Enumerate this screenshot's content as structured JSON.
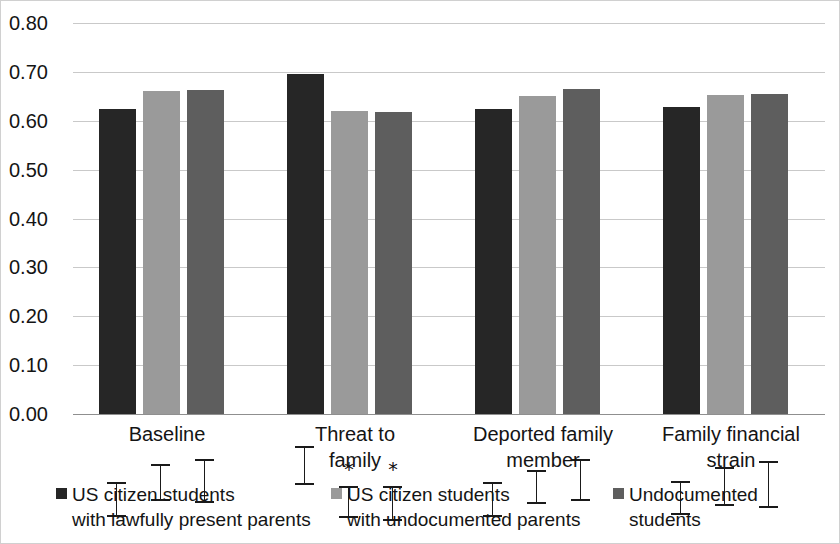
{
  "chart_data": {
    "type": "bar",
    "title": "",
    "subtitle": "",
    "xlabel": "",
    "ylabel": "",
    "ylim": [
      0.0,
      0.8
    ],
    "grid": true,
    "legend_position": "bottom",
    "ytick_labels": [
      "0.80",
      "0.70",
      "0.60",
      "0.50",
      "0.40",
      "0.30",
      "0.20",
      "0.10",
      "0.00"
    ],
    "ytick_values": [
      0.8,
      0.7,
      0.6,
      0.5,
      0.4,
      0.3,
      0.2,
      0.1,
      0.0
    ],
    "categories": [
      "Baseline",
      "Threat to\nfamily",
      "Deported family\nmember",
      "Family financial\nstrain"
    ],
    "series": [
      {
        "name": "US citizen students\nwith lawfully present parents",
        "color": "#262626",
        "values": [
          0.625,
          0.695,
          0.625,
          0.628
        ],
        "errors": [
          0.035,
          0.04,
          0.035,
          0.035
        ],
        "significance": [
          "",
          "",
          "",
          ""
        ]
      },
      {
        "name": "US citizen students\nwith undocumented parents",
        "color": "#9a9a9a",
        "values": [
          0.66,
          0.62,
          0.65,
          0.652
        ],
        "errors": [
          0.038,
          0.032,
          0.035,
          0.04
        ],
        "significance": [
          "",
          "*",
          "",
          ""
        ]
      },
      {
        "name": "Undocumented\nstudents",
        "color": "#5e5e5e",
        "values": [
          0.663,
          0.617,
          0.665,
          0.655
        ],
        "errors": [
          0.045,
          0.035,
          0.042,
          0.048
        ],
        "significance": [
          "",
          "*",
          "",
          ""
        ]
      }
    ],
    "significance_marker": "*"
  },
  "legend": {
    "items": [
      {
        "label": "US citizen students\nwith lawfully present parents",
        "swatch": "legend-swatch-series-0"
      },
      {
        "label": "US citizen students\nwith undocumented parents",
        "swatch": "legend-swatch-series-1"
      },
      {
        "label": "Undocumented\nstudents",
        "swatch": "legend-swatch-series-2"
      }
    ]
  }
}
